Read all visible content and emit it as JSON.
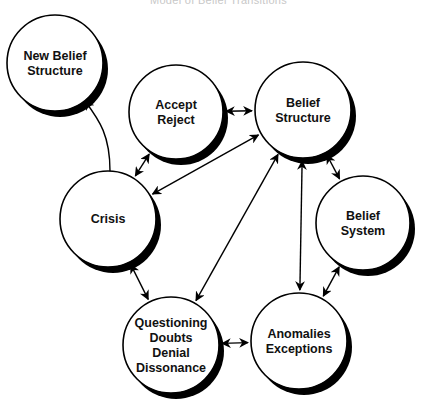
{
  "title": "Model of Belief Transitions",
  "colors": {
    "stroke": "#000000",
    "fill": "#ffffff",
    "shadow": "#000000",
    "text": "#111111"
  },
  "nodes": [
    {
      "id": "new-belief-structure",
      "lines": [
        "New Belief",
        "Structure"
      ],
      "cx": 55,
      "cy": 63,
      "r": 48
    },
    {
      "id": "accept-reject",
      "lines": [
        "Accept",
        "Reject"
      ],
      "cx": 176,
      "cy": 112,
      "r": 47
    },
    {
      "id": "belief-structure",
      "lines": [
        "Belief",
        "Structure"
      ],
      "cx": 303,
      "cy": 110,
      "r": 48
    },
    {
      "id": "belief-system",
      "lines": [
        "Belief",
        "System"
      ],
      "cx": 363,
      "cy": 223,
      "r": 47
    },
    {
      "id": "crisis",
      "lines": [
        "Crisis"
      ],
      "cx": 108,
      "cy": 219,
      "r": 48
    },
    {
      "id": "questioning",
      "lines": [
        "Questioning",
        "Doubts",
        "Denial",
        "Dissonance"
      ],
      "cx": 171,
      "cy": 345,
      "r": 48
    },
    {
      "id": "anomalies-exceptions",
      "lines": [
        "Anomalies",
        "Exceptions"
      ],
      "cx": 299,
      "cy": 341,
      "r": 48
    }
  ],
  "edges": [
    {
      "from": "crisis",
      "to": "new-belief-structure",
      "type": "one-way-curved"
    },
    {
      "from": "crisis",
      "to": "accept-reject",
      "type": "two-way"
    },
    {
      "from": "accept-reject",
      "to": "belief-structure",
      "type": "two-way"
    },
    {
      "from": "crisis",
      "to": "belief-structure",
      "type": "two-way"
    },
    {
      "from": "belief-structure",
      "to": "belief-system",
      "type": "two-way"
    },
    {
      "from": "belief-structure",
      "to": "questioning",
      "type": "two-way"
    },
    {
      "from": "belief-structure",
      "to": "anomalies-exceptions",
      "type": "two-way"
    },
    {
      "from": "belief-system",
      "to": "anomalies-exceptions",
      "type": "two-way"
    },
    {
      "from": "crisis",
      "to": "questioning",
      "type": "two-way"
    },
    {
      "from": "questioning",
      "to": "anomalies-exceptions",
      "type": "two-way"
    }
  ]
}
